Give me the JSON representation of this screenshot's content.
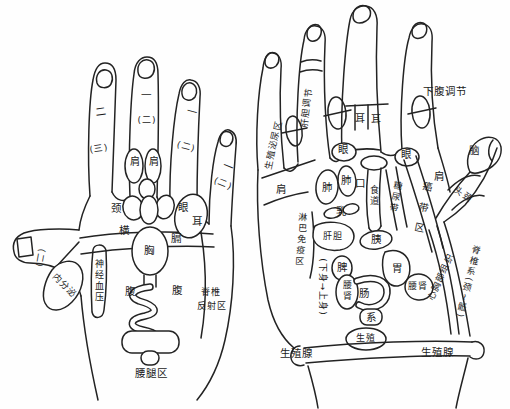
{
  "diagram": {
    "left_hand": {
      "marks": {
        "thumb": "(二)",
        "index1": "二",
        "index2": "(三)",
        "middle1": "一",
        "middle2": "(二)",
        "ring1": "一",
        "ring2": "(二)",
        "little1": "一",
        "little2": "(二)"
      },
      "labels": {
        "shoulder1": "肩",
        "shoulder2": "肩",
        "neck": "颈",
        "eye": "眼",
        "ear": "耳",
        "transverse": "横",
        "diaphragm": "膈",
        "chest": "胸",
        "nerve_bp": "神经血压",
        "endocrine": "内分泌",
        "abdomen1": "腹",
        "abdomen2": "腹",
        "spine1": "脊椎",
        "spine2": "反射区",
        "waist_leg": "腰腿区"
      }
    },
    "right_hand": {
      "labels": {
        "genitourinary": "生殖泌尿区",
        "liver_gb_reg": "肝胆调节",
        "ear1": "耳",
        "ear2": "耳",
        "lower_abdomen_reg": "下腹调节",
        "brain": "脑",
        "eye1": "眼",
        "eye2": "眼",
        "shoulder1": "肩",
        "shoulder2": "肩",
        "head_neck": "头颈",
        "lung1": "肺",
        "lung2": "肺",
        "mouth": "口",
        "esophagus": "食道",
        "diabetes_band": "糖尿带",
        "cancer_band": "癌带区",
        "breast": "乳",
        "lymph_immune": "淋巴免疫区",
        "liver_gb": "肝胆",
        "pancreas": "胰",
        "stomach": "胃",
        "spleen": "脾",
        "waist_kidney1": "腰肾",
        "intestine": "肠",
        "system": "系",
        "direction": "(下身→上身)",
        "waist_kidney2": "腰肾",
        "heart_chest": "心胸部组织",
        "spine_system": "脊椎系(颈~骶)",
        "reproduction": "生殖",
        "gonad1": "生殖腺",
        "gonad2": "生殖腺"
      }
    }
  }
}
